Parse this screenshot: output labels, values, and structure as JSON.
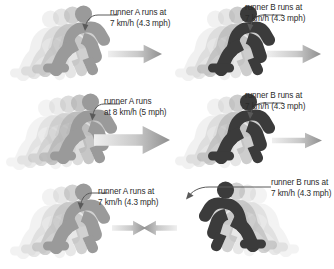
{
  "figure": {
    "background_color": "#ffffff",
    "runner_a_color": "#9a9a9a",
    "runner_b_color": "#3b3b3b",
    "ghost_color": "#d8d8d8",
    "arrow_color": "#b4b4b4",
    "text_color": "#2b2b2b"
  },
  "rows": [
    {
      "id": "row-1",
      "left": {
        "runner_name": "runner A",
        "label_line1": "runner A runs at",
        "label_line2": "7 km/h (4.3 mph)",
        "speed_kmh": 7,
        "speed_mph": 4.3,
        "direction": "right",
        "runner_shade": "light",
        "arrow_length": 50
      },
      "right": {
        "runner_name": "runner B",
        "label_line1": "runner B runs at",
        "label_line2": "7 km/h (4.3 mph)",
        "speed_kmh": 7,
        "speed_mph": 4.3,
        "direction": "right",
        "runner_shade": "dark",
        "arrow_length": 50
      }
    },
    {
      "id": "row-2",
      "left": {
        "runner_name": "runner A",
        "label_line1": "runner A runs",
        "label_line2": "at 8 km/h (5 mph)",
        "speed_kmh": 8,
        "speed_mph": 5,
        "direction": "right",
        "runner_shade": "light",
        "arrow_length": 72
      },
      "right": {
        "runner_name": "runner B",
        "label_line1": "runner B runs at",
        "label_line2": "7 km/h (4.3 mph)",
        "speed_kmh": 7,
        "speed_mph": 4.3,
        "direction": "right",
        "runner_shade": "dark",
        "arrow_length": 50
      }
    },
    {
      "id": "row-3",
      "left": {
        "runner_name": "runner A",
        "label_line1": "runner A runs at",
        "label_line2": "7 km/h (4.3 mph)",
        "speed_kmh": 7,
        "speed_mph": 4.3,
        "direction": "right",
        "runner_shade": "light",
        "arrow_length": 34
      },
      "right": {
        "runner_name": "runner B",
        "label_line1": "runner B runs at",
        "label_line2": "7 km/h (4.3 mph)",
        "speed_kmh": 7,
        "speed_mph": 4.3,
        "direction": "left",
        "runner_shade": "dark",
        "arrow_length": 34
      }
    }
  ]
}
